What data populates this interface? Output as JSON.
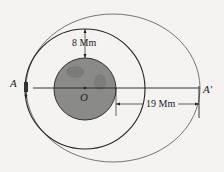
{
  "diagram": {
    "labels": {
      "A": "A",
      "A_prime": "A′",
      "O": "O",
      "dim_top": "8 Mm",
      "dim_right": "19 Mm"
    },
    "colors": {
      "planet": "#8a8a88",
      "planet_dark": "#6f6f6d",
      "line": "#333333",
      "background": "#f4f3f1"
    }
  }
}
